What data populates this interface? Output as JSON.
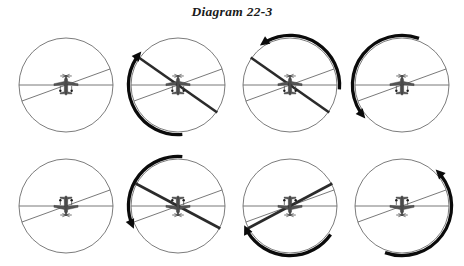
{
  "document": {
    "title": "Diagram 22-3",
    "caption_position": "top-center"
  },
  "canvas": {
    "width": 464,
    "height": 266,
    "background": "#ffffff"
  },
  "style": {
    "circle_stroke": "#5a5a5a",
    "thin_line_stroke": "#6a6a6a",
    "thick_line_stroke": "#2b2b2b",
    "arrow_stroke": "#0b0b0b",
    "aircraft_fill": "#4a4a4a",
    "title_color": "#1a1a1a"
  },
  "figure": {
    "kind": "aviation-attitude-series",
    "rows": 2,
    "columns": 4,
    "panel_count": 8,
    "panels": [
      {
        "index": 1,
        "name": "panel-1",
        "row": 1,
        "column": 1,
        "left": 8,
        "top": 27,
        "radius": 47,
        "aircraft": {
          "orientation": "upright",
          "rotation_deg": 0
        },
        "horizon_line": {
          "present": true,
          "type": "thin",
          "angle_deg": 0
        },
        "reference_line": {
          "present": true,
          "type": "thin",
          "angle_deg": 70
        },
        "bank_line": {
          "present": false,
          "type": "none",
          "angle_deg": 0
        },
        "rotation_arrow": {
          "present": false,
          "direction": "none",
          "start_deg": 0,
          "sweep_deg": 0
        }
      },
      {
        "index": 2,
        "name": "panel-2",
        "row": 1,
        "column": 2,
        "left": 120,
        "top": 27,
        "radius": 47,
        "aircraft": {
          "orientation": "upright",
          "rotation_deg": 0
        },
        "horizon_line": {
          "present": true,
          "type": "thin",
          "angle_deg": 0
        },
        "reference_line": {
          "present": true,
          "type": "thin",
          "angle_deg": 70
        },
        "bank_line": {
          "present": true,
          "type": "thick",
          "angle_deg": -55
        },
        "rotation_arrow": {
          "present": true,
          "direction": "clockwise",
          "start_deg": 175,
          "sweep_deg": 135
        }
      },
      {
        "index": 3,
        "name": "panel-3",
        "row": 1,
        "column": 3,
        "left": 232,
        "top": 27,
        "radius": 47,
        "aircraft": {
          "orientation": "upright",
          "rotation_deg": 0
        },
        "horizon_line": {
          "present": true,
          "type": "thin",
          "angle_deg": 0
        },
        "reference_line": {
          "present": true,
          "type": "thin",
          "angle_deg": 70
        },
        "bank_line": {
          "present": true,
          "type": "thick",
          "angle_deg": -55
        },
        "rotation_arrow": {
          "present": true,
          "direction": "counterclockwise",
          "start_deg": 95,
          "sweep_deg": 130
        }
      },
      {
        "index": 4,
        "name": "panel-4",
        "row": 1,
        "column": 4,
        "left": 344,
        "top": 27,
        "radius": 47,
        "aircraft": {
          "orientation": "upright",
          "rotation_deg": 0
        },
        "horizon_line": {
          "present": true,
          "type": "thin",
          "angle_deg": 0
        },
        "reference_line": {
          "present": true,
          "type": "thin",
          "angle_deg": 70
        },
        "bank_line": {
          "present": false,
          "type": "none",
          "angle_deg": 0
        },
        "rotation_arrow": {
          "present": true,
          "direction": "counterclockwise",
          "start_deg": 20,
          "sweep_deg": 150
        }
      },
      {
        "index": 5,
        "name": "panel-5",
        "row": 2,
        "column": 1,
        "left": 8,
        "top": 148,
        "radius": 47,
        "aircraft": {
          "orientation": "inverted",
          "rotation_deg": 180
        },
        "horizon_line": {
          "present": true,
          "type": "thin",
          "angle_deg": 0
        },
        "reference_line": {
          "present": true,
          "type": "thin",
          "angle_deg": 70
        },
        "bank_line": {
          "present": false,
          "type": "none",
          "angle_deg": 0
        },
        "rotation_arrow": {
          "present": false,
          "direction": "none",
          "start_deg": 0,
          "sweep_deg": 0
        }
      },
      {
        "index": 6,
        "name": "panel-6",
        "row": 2,
        "column": 2,
        "left": 120,
        "top": 148,
        "radius": 47,
        "aircraft": {
          "orientation": "inverted",
          "rotation_deg": 180
        },
        "horizon_line": {
          "present": true,
          "type": "thin",
          "angle_deg": 0
        },
        "reference_line": {
          "present": true,
          "type": "thin",
          "angle_deg": 70
        },
        "bank_line": {
          "present": true,
          "type": "thick",
          "angle_deg": -62
        },
        "rotation_arrow": {
          "present": true,
          "direction": "counterclockwise",
          "start_deg": 5,
          "sweep_deg": 120
        }
      },
      {
        "index": 7,
        "name": "panel-7",
        "row": 2,
        "column": 3,
        "left": 232,
        "top": 148,
        "radius": 47,
        "aircraft": {
          "orientation": "inverted",
          "rotation_deg": 180
        },
        "horizon_line": {
          "present": true,
          "type": "thin",
          "angle_deg": 0
        },
        "reference_line": {
          "present": true,
          "type": "thin",
          "angle_deg": 70
        },
        "bank_line": {
          "present": true,
          "type": "thick",
          "angle_deg": 62
        },
        "rotation_arrow": {
          "present": true,
          "direction": "clockwise",
          "start_deg": 125,
          "sweep_deg": 120
        }
      },
      {
        "index": 8,
        "name": "panel-8",
        "row": 2,
        "column": 4,
        "left": 344,
        "top": 148,
        "radius": 47,
        "aircraft": {
          "orientation": "inverted",
          "rotation_deg": 180
        },
        "horizon_line": {
          "present": true,
          "type": "thin",
          "angle_deg": 0
        },
        "reference_line": {
          "present": true,
          "type": "thin",
          "angle_deg": 70
        },
        "bank_line": {
          "present": false,
          "type": "none",
          "angle_deg": 0
        },
        "rotation_arrow": {
          "present": true,
          "direction": "counterclockwise",
          "start_deg": 200,
          "sweep_deg": 155
        }
      }
    ]
  }
}
